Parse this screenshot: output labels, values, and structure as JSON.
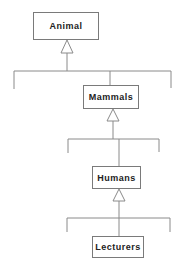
{
  "diagram": {
    "type": "class-inheritance-hierarchy",
    "colors": {
      "line": "#8a8a8a",
      "border": "#7a7a7a",
      "text": "#222222",
      "background": "#ffffff"
    },
    "classes": [
      {
        "id": "animal",
        "label": "Animal"
      },
      {
        "id": "mammals",
        "label": "Mammals"
      },
      {
        "id": "humans",
        "label": "Humans"
      },
      {
        "id": "lecturers",
        "label": "Lecturers"
      }
    ],
    "relations": [
      {
        "child": "mammals",
        "parent": "animal",
        "kind": "generalization"
      },
      {
        "child": "humans",
        "parent": "mammals",
        "kind": "generalization"
      },
      {
        "child": "lecturers",
        "parent": "humans",
        "kind": "generalization"
      }
    ]
  }
}
